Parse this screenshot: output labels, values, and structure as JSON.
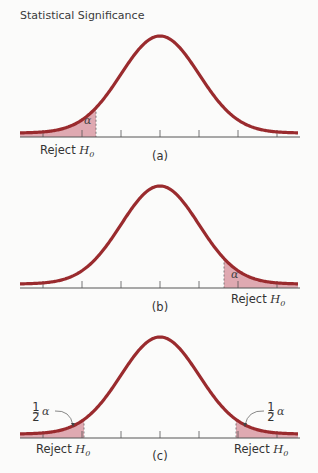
{
  "title": "Statistical Significance",
  "colors": {
    "curve": "#9a2b2e",
    "fill": "#d68e98",
    "axis": "#555555",
    "background": "#fbfbfa"
  },
  "chart_data": [
    {
      "type": "area",
      "panel": "(a)",
      "title": "One-tailed test, left tail",
      "distribution": "normal",
      "x_ticks": [
        -3,
        -2,
        -1,
        0,
        1,
        2,
        3
      ],
      "rejection_region": {
        "side": "left",
        "boundary": -1.65
      },
      "region_label": "α",
      "axis_label": "Reject H0",
      "grid": false
    },
    {
      "type": "area",
      "panel": "(b)",
      "title": "One-tailed test, right tail",
      "distribution": "normal",
      "x_ticks": [
        -3,
        -2,
        -1,
        0,
        1,
        2,
        3
      ],
      "rejection_region": {
        "side": "right",
        "boundary": 1.65
      },
      "region_label": "α",
      "axis_label": "Reject H0",
      "grid": false
    },
    {
      "type": "area",
      "panel": "(c)",
      "title": "Two-tailed test",
      "distribution": "normal",
      "x_ticks": [
        -3,
        -2,
        -1,
        0,
        1,
        2,
        3
      ],
      "rejection_region": {
        "side": "both",
        "boundary": [
          -1.96,
          1.96
        ]
      },
      "region_label": "½α",
      "axis_label": "Reject H0",
      "grid": false
    }
  ],
  "panels": {
    "a": {
      "label": "(a)",
      "alpha": "α",
      "reject": "Reject ",
      "h": "H",
      "sub": "0"
    },
    "b": {
      "label": "(b)",
      "alpha": "α",
      "reject": "Reject ",
      "h": "H",
      "sub": "0"
    },
    "c": {
      "label": "(c)",
      "half_num": "1",
      "half_den": "2",
      "alpha": "α",
      "reject": "Reject ",
      "h": "H",
      "sub": "0"
    }
  }
}
